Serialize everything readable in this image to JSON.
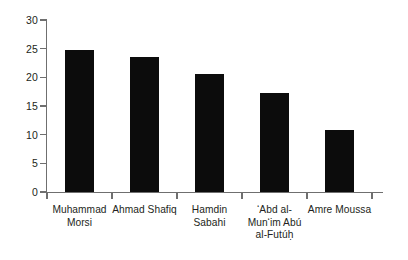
{
  "chart_data": {
    "type": "bar",
    "title": "",
    "subtitle": "",
    "xlabel": "",
    "ylabel": "",
    "categories": [
      "Muhammad\nMorsi",
      "Ahmad Shafiq",
      "Hamdin\nSabahi",
      "‘Abd al-\nMun‘im Abú\nal-Futúḥ",
      "Amre Moussa"
    ],
    "values": [
      24.8,
      23.5,
      20.6,
      17.3,
      10.8
    ],
    "ylim": [
      0,
      30
    ],
    "yticks": [
      0,
      5,
      10,
      15,
      20,
      25,
      30
    ],
    "ytick_labels": [
      "0",
      "5",
      "10",
      "15",
      "20",
      "25",
      "30"
    ],
    "grid": false,
    "legend": null,
    "bar_color": "#0c0c0c",
    "axis_color": "#6f6f6f",
    "text_color": "#231f20",
    "background": "#ffffff"
  }
}
